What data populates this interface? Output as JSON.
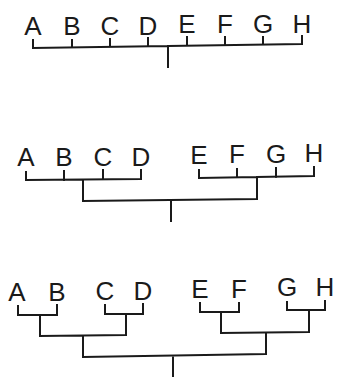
{
  "diagram": {
    "type": "tree-diagrams",
    "panels": [
      {
        "name": "flat-tree",
        "description": "All eight leaves attach to a single bar",
        "leaves": [
          {
            "label": "A",
            "x": 33
          },
          {
            "label": "B",
            "x": 72
          },
          {
            "label": "C",
            "x": 110
          },
          {
            "label": "D",
            "x": 148
          },
          {
            "label": "E",
            "x": 187
          },
          {
            "label": "F",
            "x": 225
          },
          {
            "label": "G",
            "x": 263
          },
          {
            "label": "H",
            "x": 302
          }
        ],
        "structure": "(A,B,C,D,E,F,G,H)"
      },
      {
        "name": "two-group-tree",
        "description": "Two groups of four leaves joined at root",
        "leaves": [
          {
            "label": "A",
            "x": 26
          },
          {
            "label": "B",
            "x": 64
          },
          {
            "label": "C",
            "x": 103
          },
          {
            "label": "D",
            "x": 141
          },
          {
            "label": "E",
            "x": 199
          },
          {
            "label": "F",
            "x": 237
          },
          {
            "label": "G",
            "x": 276
          },
          {
            "label": "H",
            "x": 314
          }
        ],
        "structure": "((A,B,C,D),(E,F,G,H))"
      },
      {
        "name": "binary-tree",
        "description": "Fully bifurcating tree of pairs",
        "leaves": [
          {
            "label": "A",
            "x": 18
          },
          {
            "label": "B",
            "x": 57
          },
          {
            "label": "C",
            "x": 105
          },
          {
            "label": "D",
            "x": 143
          },
          {
            "label": "E",
            "x": 200
          },
          {
            "label": "F",
            "x": 239
          },
          {
            "label": "G",
            "x": 287
          },
          {
            "label": "H",
            "x": 325
          }
        ],
        "structure": "(((A,B),(C,D)),((E,F),(G,H)))"
      }
    ]
  }
}
